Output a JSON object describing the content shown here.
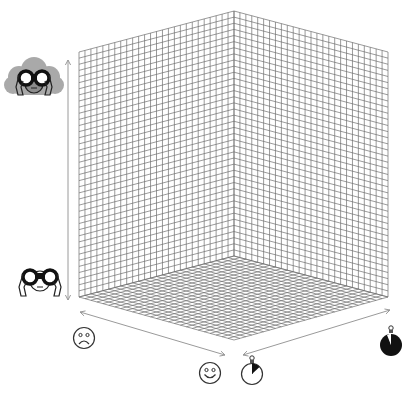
{
  "diagram": {
    "type": "3d-cube-grid",
    "background": "#ffffff",
    "grid_color": "#6e6e6e",
    "axis_color": "#9a9a9a",
    "corners": {
      "back_top": [
        234,
        11
      ],
      "left_top": [
        79,
        52
      ],
      "right_top": [
        388,
        52
      ],
      "back_bottom": [
        234,
        256
      ],
      "left_bottom": [
        79,
        297
      ],
      "right_bottom": [
        388,
        297
      ],
      "front_bottom": [
        234,
        340
      ]
    },
    "grid": {
      "left_wall_cols": 26,
      "right_wall_cols": 26,
      "wall_rows": 40,
      "floor_rows_left": 26,
      "floor_rows_right": 26
    }
  },
  "axes": {
    "vertical": {
      "label_top": "binoculars-with-cloud (high uncertainty)",
      "label_bottom": "binoculars (clear view)",
      "arrow": "double-headed",
      "from": [
        68,
        60
      ],
      "to": [
        68,
        300
      ]
    },
    "left_floor": {
      "label_end": "sad-face",
      "arrow": "double-headed",
      "from": [
        80,
        312
      ],
      "to": [
        225,
        355
      ]
    },
    "right_floor": {
      "label_start": "timer-small-fraction",
      "label_end": "timer-large-fraction",
      "arrow": "double-headed",
      "from": [
        243,
        355
      ],
      "to": [
        390,
        310
      ]
    }
  },
  "icons": [
    {
      "name": "cloudy-binoculars-icon",
      "x": 3,
      "y": 55,
      "w": 62,
      "h": 48
    },
    {
      "name": "binoculars-icon",
      "x": 15,
      "y": 265,
      "w": 50,
      "h": 36
    },
    {
      "name": "sad-face-icon",
      "x": 72,
      "y": 326,
      "w": 24,
      "h": 24
    },
    {
      "name": "smiley-face-icon",
      "x": 198,
      "y": 361,
      "w": 24,
      "h": 24
    },
    {
      "name": "timer-small-icon",
      "x": 240,
      "y": 354,
      "w": 24,
      "h": 34
    },
    {
      "name": "timer-large-icon",
      "x": 378,
      "y": 324,
      "w": 26,
      "h": 34
    }
  ]
}
